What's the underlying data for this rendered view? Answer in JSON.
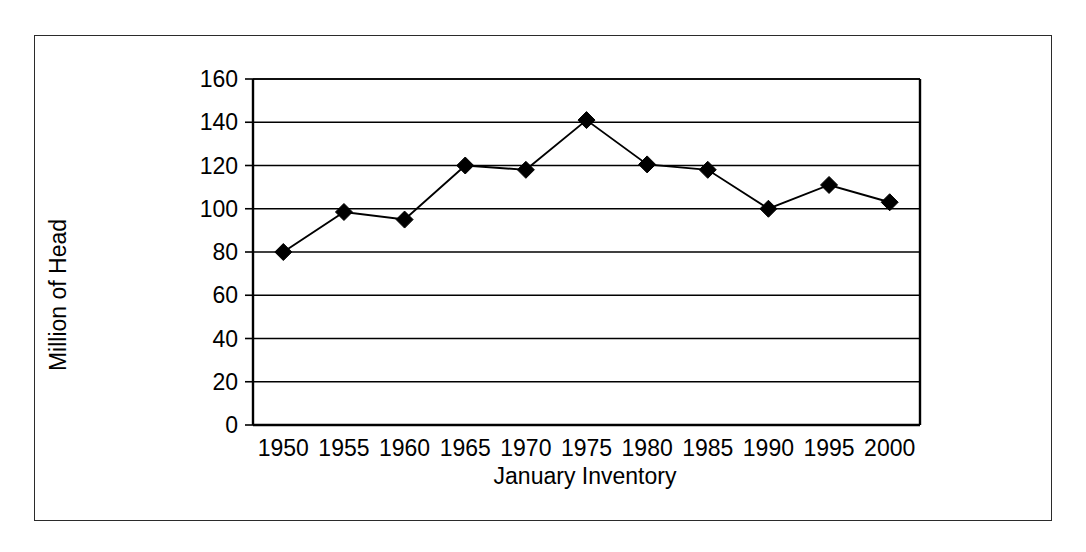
{
  "chart_data": {
    "type": "line",
    "title": "",
    "xlabel": "January Inventory",
    "ylabel": "Million of Head",
    "x": [
      1950,
      1955,
      1960,
      1965,
      1970,
      1975,
      1980,
      1985,
      1990,
      1995,
      2000
    ],
    "categories": [
      "1950",
      "1955",
      "1960",
      "1965",
      "1970",
      "1975",
      "1980",
      "1985",
      "1990",
      "1995",
      "2000"
    ],
    "values": [
      80,
      98.5,
      95,
      120,
      118,
      141,
      120.5,
      118,
      100,
      111,
      103
    ],
    "series": [
      {
        "name": "January Inventory",
        "values": [
          80,
          98.5,
          95,
          120,
          118,
          141,
          120.5,
          118,
          100,
          111,
          103
        ]
      }
    ],
    "ylim": [
      0,
      160
    ],
    "yticks": [
      0,
      20,
      40,
      60,
      80,
      100,
      120,
      140,
      160
    ],
    "ytick_labels": [
      "0",
      "20",
      "40",
      "60",
      "80",
      "100",
      "120",
      "140",
      "160"
    ],
    "xtick_labels": [
      "1950",
      "1955",
      "1960",
      "1965",
      "1970",
      "1975",
      "1980",
      "1985",
      "1990",
      "1995",
      "2000"
    ],
    "grid": "horizontal",
    "legend": "none",
    "marker": "diamond",
    "marker_color": "#000000",
    "line_color": "#000000",
    "background_color": "#ffffff",
    "frame_color": "#2b2b2b"
  }
}
